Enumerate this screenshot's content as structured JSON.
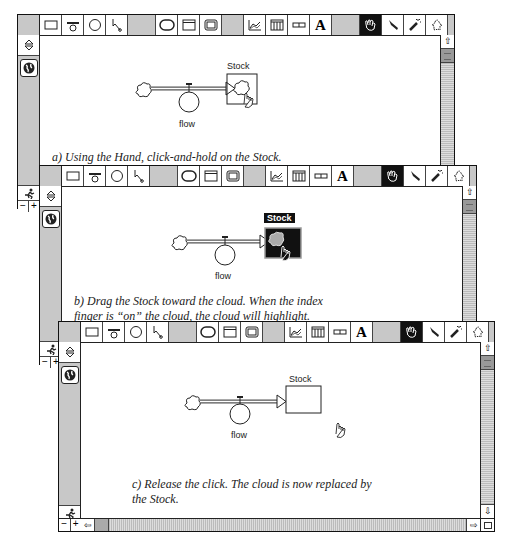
{
  "toolbar": {
    "tools": [
      {
        "name": "stock-tool",
        "glyph": "▭"
      },
      {
        "name": "flow-tool",
        "glyph": "ಠ"
      },
      {
        "name": "converter-tool",
        "glyph": "○"
      },
      {
        "name": "connector-tool",
        "glyph": "↖"
      },
      {
        "name": "decision-process-tool",
        "glyph": "⬭"
      },
      {
        "name": "sector-frame-tool",
        "glyph": "▤"
      },
      {
        "name": "button-tool",
        "glyph": "▣"
      },
      {
        "name": "graph-pad-tool",
        "glyph": "⩘"
      },
      {
        "name": "table-pad-tool",
        "glyph": "▥"
      },
      {
        "name": "numeric-display-tool",
        "glyph": "▭"
      },
      {
        "name": "text-tool",
        "glyph": "A"
      },
      {
        "name": "hand-tool",
        "glyph": "☚"
      },
      {
        "name": "paintbrush-tool",
        "glyph": "✎"
      },
      {
        "name": "dynamite-tool",
        "glyph": "✧"
      },
      {
        "name": "ghost-tool",
        "glyph": "♙"
      }
    ],
    "selected_tool": "hand-tool"
  },
  "left_panel": {
    "updown_glyph": "⇳",
    "globe_glyph": "🌐",
    "run_glyph": "🏃",
    "zoom_out": "−",
    "zoom_in": "+"
  },
  "scroll": {
    "up_arrow": "⇧",
    "down_arrow": "⇩",
    "left_arrow": "⇦",
    "right_arrow": "⇨"
  },
  "panels": [
    {
      "id": "a",
      "stock_label": "Stock",
      "flow_label": "flow",
      "caption": "a)  Using the Hand, click-and-hold on the Stock."
    },
    {
      "id": "b",
      "stock_label": "Stock",
      "flow_label": "flow",
      "caption_line1": "b)  Drag the Stock toward the cloud.  When the index",
      "caption_line2": "finger is “on” the cloud, the cloud will highlight."
    },
    {
      "id": "c",
      "stock_label": "Stock",
      "flow_label": "flow",
      "caption_line1": "c)  Release the click.  The cloud is now replaced by",
      "caption_line2": "the Stock."
    }
  ]
}
